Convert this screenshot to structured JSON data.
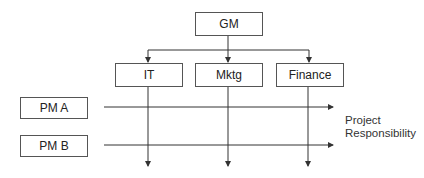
{
  "diagram": {
    "type": "matrix-organization-chart",
    "top": {
      "id": "gm",
      "label": "GM"
    },
    "departments": [
      {
        "id": "it",
        "label": "IT"
      },
      {
        "id": "mktg",
        "label": "Mktg"
      },
      {
        "id": "finance",
        "label": "Finance"
      }
    ],
    "project_managers": [
      {
        "id": "pm-a",
        "label": "PM A"
      },
      {
        "id": "pm-b",
        "label": "PM B"
      }
    ],
    "annotation": {
      "line1": "Project",
      "line2": "Responsibility"
    },
    "edges": [
      {
        "from": "GM",
        "to": "IT"
      },
      {
        "from": "GM",
        "to": "Mktg"
      },
      {
        "from": "GM",
        "to": "Finance"
      },
      {
        "from": "PM A",
        "to": "Project Responsibility",
        "direction": "horizontal"
      },
      {
        "from": "PM B",
        "to": "Project Responsibility",
        "direction": "horizontal"
      },
      {
        "from": "IT",
        "to": "below",
        "direction": "vertical"
      },
      {
        "from": "Mktg",
        "to": "below",
        "direction": "vertical"
      },
      {
        "from": "Finance",
        "to": "below",
        "direction": "vertical"
      }
    ],
    "colors": {
      "line": "#333333",
      "box_border": "#555555",
      "text": "#222222"
    }
  }
}
